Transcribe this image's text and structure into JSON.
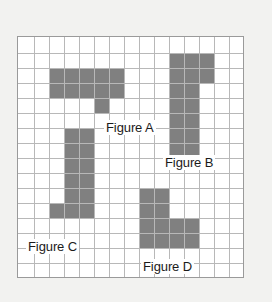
{
  "figure": {
    "background_color": "#f2f2f0",
    "grid_background_color": "#ffffff",
    "grid_line_color": "#b8b8b8",
    "grid_border_color": "#9a9a9a",
    "shape_fill_color": "#808080",
    "label_text_color": "#1b1b1b"
  },
  "grid": {
    "columns": 15,
    "rows": 16,
    "cell_size_px": 15,
    "origin_x_px": 17,
    "origin_y_px": 36
  },
  "chart_data": {
    "type": "diagram",
    "grid_columns": 15,
    "grid_rows": 16,
    "shapes": [
      {
        "name": "Figure A",
        "label": "Figure A",
        "cell_count": 11,
        "color": "#808080",
        "cells": [
          [
            2,
            2
          ],
          [
            3,
            2
          ],
          [
            4,
            2
          ],
          [
            5,
            2
          ],
          [
            6,
            2
          ],
          [
            2,
            3
          ],
          [
            3,
            3
          ],
          [
            4,
            3
          ],
          [
            5,
            3
          ],
          [
            6,
            3
          ],
          [
            5,
            4
          ]
        ]
      },
      {
        "name": "Figure B",
        "label": "Figure B",
        "cell_count": 11,
        "color": "#808080",
        "cells": [
          [
            10,
            1
          ],
          [
            11,
            1
          ],
          [
            12,
            1
          ],
          [
            10,
            2
          ],
          [
            11,
            2
          ],
          [
            12,
            2
          ],
          [
            10,
            3
          ],
          [
            11,
            3
          ],
          [
            10,
            4
          ],
          [
            11,
            4
          ],
          [
            10,
            5
          ],
          [
            11,
            5
          ],
          [
            10,
            6
          ],
          [
            11,
            6
          ],
          [
            10,
            7
          ],
          [
            11,
            7
          ]
        ]
      },
      {
        "name": "Figure C",
        "label": "Figure C",
        "cell_count": 11,
        "color": "#808080",
        "cells": [
          [
            3,
            6
          ],
          [
            4,
            6
          ],
          [
            3,
            7
          ],
          [
            4,
            7
          ],
          [
            3,
            8
          ],
          [
            4,
            8
          ],
          [
            3,
            9
          ],
          [
            4,
            9
          ],
          [
            3,
            10
          ],
          [
            4,
            10
          ],
          [
            2,
            11
          ],
          [
            3,
            11
          ],
          [
            4,
            11
          ]
        ]
      },
      {
        "name": "Figure D",
        "label": "Figure D",
        "cell_count": 11,
        "color": "#808080",
        "cells": [
          [
            8,
            10
          ],
          [
            9,
            10
          ],
          [
            8,
            11
          ],
          [
            9,
            11
          ],
          [
            8,
            12
          ],
          [
            9,
            12
          ],
          [
            10,
            12
          ],
          [
            11,
            12
          ],
          [
            8,
            13
          ],
          [
            9,
            13
          ],
          [
            10,
            13
          ],
          [
            11,
            13
          ]
        ]
      }
    ],
    "labels": [
      {
        "text": "Figure A",
        "x_px": 104,
        "y_px": 120
      },
      {
        "text": "Figure B",
        "x_px": 163,
        "y_px": 155
      },
      {
        "text": "Figure C",
        "x_px": 26,
        "y_px": 239
      },
      {
        "text": "Figure D",
        "x_px": 141,
        "y_px": 259
      }
    ]
  },
  "labels": {
    "figure_a": "Figure A",
    "figure_b": "Figure B",
    "figure_c": "Figure C",
    "figure_d": "Figure D"
  }
}
